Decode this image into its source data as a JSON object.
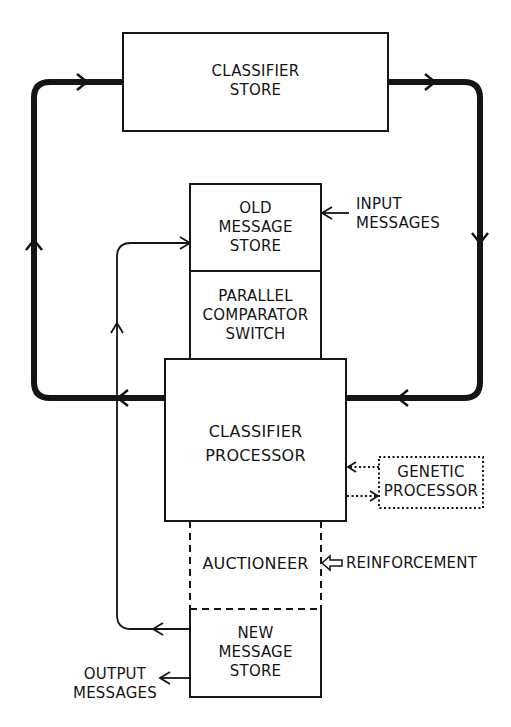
{
  "diagram": {
    "type": "block-diagram",
    "colors": {
      "ink": "#151515",
      "background": "#ffffff"
    },
    "blocks": {
      "classifier_store": {
        "label": "CLASSIFIER\nSTORE",
        "border": "solid"
      },
      "old_message_store": {
        "label": "OLD\nMESSAGE\nSTORE",
        "border": "solid"
      },
      "parallel_comparator_switch": {
        "label": "PARALLEL\nCOMPARATOR\nSWITCH",
        "border": "solid"
      },
      "classifier_processor": {
        "label": "CLASSIFIER\nPROCESSOR",
        "border": "solid"
      },
      "genetic_processor": {
        "label": "GENETIC\nPROCESSOR",
        "border": "dotted"
      },
      "auctioneer": {
        "label": "AUCTIONEER",
        "border": "dashed"
      },
      "new_message_store": {
        "label": "NEW\nMESSAGE\nSTORE",
        "border": "solid"
      }
    },
    "external_labels": {
      "input_messages": "INPUT\nMESSAGES",
      "reinforcement": "REINFORCEMENT",
      "output_messages": "OUTPUT\nMESSAGES"
    },
    "connections": [
      {
        "from": "classifier_store",
        "to": "classifier_processor",
        "style": "thick",
        "route": "right loop, downward"
      },
      {
        "from": "classifier_processor",
        "to": "classifier_store",
        "style": "thick",
        "route": "left loop, upward"
      },
      {
        "from": "input_messages",
        "to": "old_message_store",
        "style": "thin"
      },
      {
        "from": "new_message_store",
        "to": "old_message_store",
        "style": "thin",
        "route": "left side, upward"
      },
      {
        "from": "genetic_processor",
        "to": "classifier_processor",
        "style": "dotted"
      },
      {
        "from": "classifier_processor",
        "to": "genetic_processor",
        "style": "dotted"
      },
      {
        "from": "reinforcement",
        "to": "auctioneer",
        "style": "hollow-arrow"
      },
      {
        "from": "new_message_store",
        "to": "output_messages",
        "style": "thin"
      }
    ]
  }
}
